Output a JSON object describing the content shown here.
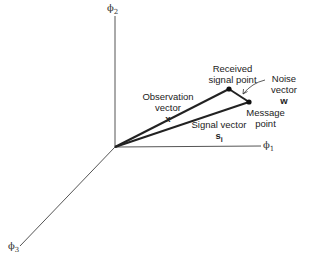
{
  "diagram": {
    "type": "signal-space vector diagram",
    "axes": {
      "phi1": {
        "symbol": "ϕ",
        "sub": "1"
      },
      "phi2": {
        "symbol": "ϕ",
        "sub": "2"
      },
      "phi3": {
        "symbol": "ϕ",
        "sub": "3"
      }
    },
    "labels": {
      "received_1": "Received",
      "received_2": "signal point",
      "noise_1": "Noise",
      "noise_2": "vector",
      "noise_3": "w",
      "observation_1": "Observation",
      "observation_2": "vector",
      "observation_3": "x",
      "message_1": "Message",
      "message_2": "point",
      "signal_1": "Signal vector",
      "signal_2": "s",
      "signal_2_sub": "i"
    },
    "colors": {
      "lines": "#222222",
      "axes": "#444444",
      "background": "#ffffff"
    }
  }
}
